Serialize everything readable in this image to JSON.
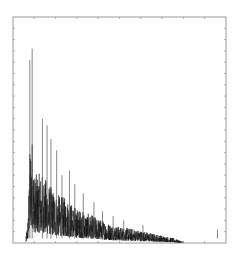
{
  "chart_data": {
    "type": "line",
    "title": "",
    "xlabel": "",
    "ylabel": "",
    "legend": [],
    "grid": false,
    "xlim": [
      0,
      1
    ],
    "ylim": [
      0,
      1
    ],
    "tick_labels": {
      "x": [],
      "y": []
    },
    "frame": {
      "left": 13,
      "top": 17,
      "right": 226,
      "bottom": 243
    },
    "y_tick_count": 20,
    "x_tick_count": 10,
    "colors": {
      "trace": "#111111",
      "frame": "#9a9a9a",
      "ticks": "#b5b5b5",
      "background": "#ffffff"
    },
    "envelope": {
      "description": "Dense noisy spectrum; sharp rise near x=0.07, tallest spikes at x~0.08-0.09, decaying envelope to near zero by x~0.80, isolated small spike near x~0.96",
      "x": [
        0.0,
        0.04,
        0.06,
        0.07,
        0.08,
        0.085,
        0.09,
        0.1,
        0.12,
        0.14,
        0.16,
        0.18,
        0.2,
        0.25,
        0.3,
        0.35,
        0.4,
        0.45,
        0.5,
        0.55,
        0.6,
        0.65,
        0.7,
        0.75,
        0.8,
        0.85,
        0.9,
        0.96,
        1.0
      ],
      "y": [
        0.0,
        0.01,
        0.03,
        0.2,
        0.8,
        0.83,
        0.86,
        0.55,
        0.56,
        0.55,
        0.5,
        0.45,
        0.4,
        0.36,
        0.28,
        0.24,
        0.2,
        0.16,
        0.13,
        0.12,
        0.1,
        0.08,
        0.06,
        0.04,
        0.01,
        0.005,
        0.005,
        0.06,
        0.0
      ]
    },
    "peaks": [
      {
        "x": 0.079,
        "y": 0.81
      },
      {
        "x": 0.09,
        "y": 0.86
      },
      {
        "x": 0.138,
        "y": 0.55
      },
      {
        "x": 0.16,
        "y": 0.52
      },
      {
        "x": 0.178,
        "y": 0.46
      },
      {
        "x": 0.205,
        "y": 0.41
      },
      {
        "x": 0.23,
        "y": 0.3
      },
      {
        "x": 0.265,
        "y": 0.32
      },
      {
        "x": 0.29,
        "y": 0.26
      },
      {
        "x": 0.33,
        "y": 0.22
      },
      {
        "x": 0.38,
        "y": 0.18
      },
      {
        "x": 0.42,
        "y": 0.14
      },
      {
        "x": 0.47,
        "y": 0.12
      },
      {
        "x": 0.52,
        "y": 0.1
      },
      {
        "x": 0.61,
        "y": 0.08
      },
      {
        "x": 0.96,
        "y": 0.06
      }
    ]
  }
}
